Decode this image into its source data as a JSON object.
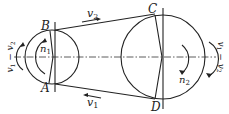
{
  "diagram": {
    "points": {
      "A": "A",
      "B": "B",
      "C": "C",
      "D": "D"
    },
    "velocities": {
      "upper_belt": "v2",
      "lower_belt": "v1"
    },
    "speeds": {
      "small_pulley": "n1",
      "large_pulley": "n2"
    },
    "slip_labels": {
      "left": "v1 − v2",
      "right": "v1 − v2"
    },
    "small_pulley": {
      "cx": 52,
      "cy": 57,
      "r": 27
    },
    "large_pulley": {
      "cx": 163,
      "cy": 57,
      "r": 42
    },
    "colors": {
      "line": "#222222",
      "background": "#ffffff"
    }
  }
}
